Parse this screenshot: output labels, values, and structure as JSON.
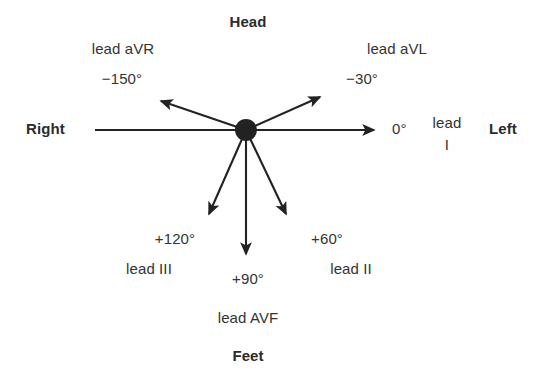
{
  "figure": {
    "type": "ecg-hexaxial-reference-diagram",
    "background_color": "#ffffff",
    "stroke_color": "#222222",
    "text_color": "#333333"
  },
  "orientation_labels": {
    "head": "Head",
    "feet": "Feet",
    "right": "Right",
    "left": "Left"
  },
  "center": {
    "x": 246,
    "y": 130,
    "radius": 11
  },
  "axes": [
    {
      "id": "avr",
      "lead_label": "lead aVR",
      "angle_label": "−150°",
      "angle_degrees": -150,
      "tip": {
        "x": 154,
        "y": 97
      }
    },
    {
      "id": "avl",
      "lead_label": "lead aVL",
      "angle_label": "−30°",
      "angle_degrees": -30,
      "tip": {
        "x": 327,
        "y": 92
      }
    },
    {
      "id": "i",
      "lead_label_line1": "lead",
      "lead_label_line2": "I",
      "angle_label": "0°",
      "angle_degrees": 0,
      "tip": {
        "x": 382,
        "y": 130
      }
    },
    {
      "id": "ii",
      "lead_label": "lead II",
      "angle_label": "+60°",
      "angle_degrees": 60,
      "tip": {
        "x": 290,
        "y": 222
      }
    },
    {
      "id": "avf",
      "lead_label": "lead AVF",
      "angle_label": "+90°",
      "angle_degrees": 90,
      "tip": {
        "x": 246,
        "y": 262
      }
    },
    {
      "id": "iii",
      "lead_label": "lead III",
      "angle_label": "+120°",
      "angle_degrees": 120,
      "tip": {
        "x": 205,
        "y": 222
      }
    }
  ],
  "right_tail": {
    "x": 95,
    "y": 130
  }
}
